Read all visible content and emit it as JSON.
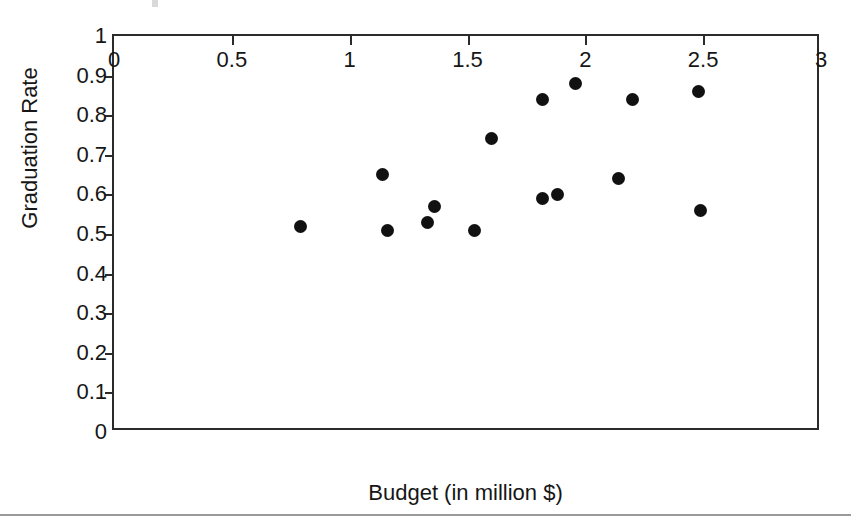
{
  "chart_data": {
    "type": "scatter",
    "title": "",
    "xlabel": "Budget (in million $)",
    "ylabel": "Graduation Rate",
    "xlim": [
      0,
      3
    ],
    "ylim": [
      0,
      1
    ],
    "xticks": [
      "0",
      "0.5",
      "1",
      "1.5",
      "2",
      "2.5",
      "3"
    ],
    "xtick_values": [
      0,
      0.5,
      1,
      1.5,
      2,
      2.5,
      3
    ],
    "yticks": [
      "0",
      "0.1",
      "0.2",
      "0.3",
      "0.4",
      "0.5",
      "0.6",
      "0.7",
      "0.8",
      "0.9",
      "1"
    ],
    "ytick_values": [
      0,
      0.1,
      0.2,
      0.3,
      0.4,
      0.5,
      0.6,
      0.7,
      0.8,
      0.9,
      1
    ],
    "grid": false,
    "legend": null,
    "legend_position": "none",
    "marker": "filled-circle",
    "marker_color": "#111111",
    "axis_color": "#2b2b2b",
    "background_color": "#ffffff",
    "x": [
      0.79,
      1.14,
      1.16,
      1.33,
      1.36,
      1.53,
      1.6,
      1.82,
      1.82,
      1.88,
      1.96,
      2.14,
      2.2,
      2.48,
      2.49
    ],
    "y": [
      0.52,
      0.65,
      0.51,
      0.53,
      0.57,
      0.51,
      0.74,
      0.59,
      0.84,
      0.6,
      0.88,
      0.64,
      0.84,
      0.86,
      0.56
    ],
    "points": [
      {
        "x": 0.79,
        "y": 0.52
      },
      {
        "x": 1.14,
        "y": 0.65
      },
      {
        "x": 1.16,
        "y": 0.51
      },
      {
        "x": 1.33,
        "y": 0.53
      },
      {
        "x": 1.36,
        "y": 0.57
      },
      {
        "x": 1.53,
        "y": 0.51
      },
      {
        "x": 1.6,
        "y": 0.74
      },
      {
        "x": 1.82,
        "y": 0.59
      },
      {
        "x": 1.82,
        "y": 0.84
      },
      {
        "x": 1.88,
        "y": 0.6
      },
      {
        "x": 1.96,
        "y": 0.88
      },
      {
        "x": 2.14,
        "y": 0.64
      },
      {
        "x": 2.2,
        "y": 0.84
      },
      {
        "x": 2.48,
        "y": 0.86
      },
      {
        "x": 2.49,
        "y": 0.56
      }
    ]
  }
}
